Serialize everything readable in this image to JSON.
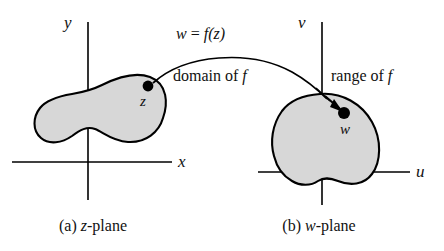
{
  "figure": {
    "colors": {
      "blob_fill": "#d7d7d7",
      "blob_stroke": "#000000",
      "axis": "#000000",
      "point": "#000000",
      "arc": "#000000",
      "background": "#ffffff"
    }
  },
  "left_panel": {
    "caption_prefix": "(a)",
    "caption_name": "z",
    "caption_suffix": "-plane",
    "caption_full": "(a) z-plane",
    "axis_vertical_label": "y",
    "axis_horizontal_label": "x",
    "point_label": "z",
    "region_label": "domain of f",
    "region_label_prefix": "domain of ",
    "region_label_italic": "f"
  },
  "right_panel": {
    "caption_prefix": "(b)",
    "caption_name": "w",
    "caption_suffix": "-plane",
    "caption_full": "(b) w-plane",
    "axis_vertical_label": "v",
    "axis_horizontal_label": "u",
    "point_label": "w",
    "region_label": "range of f",
    "region_label_prefix": "range of ",
    "region_label_italic": "f"
  },
  "mapping": {
    "formula": "w = f(z)",
    "formula_lhs": "w",
    "formula_eq": "=",
    "formula_rhs": "f(z)"
  }
}
